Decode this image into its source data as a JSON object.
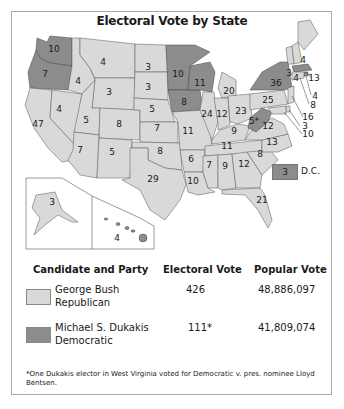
{
  "title": "Electoral Vote by State",
  "colors": {
    "republican": "#d9d9d9",
    "democratic": "#8c8c8c",
    "border": "#a9a9a9"
  },
  "states": [
    {
      "label": "10",
      "party": "democratic",
      "region": "Washington"
    },
    {
      "label": "7",
      "party": "democratic",
      "region": "Oregon"
    },
    {
      "label": "47",
      "party": "republican",
      "region": "California"
    },
    {
      "label": "4",
      "party": "republican",
      "region": "Idaho"
    },
    {
      "label": "4",
      "party": "republican",
      "region": "Nevada"
    },
    {
      "label": "4",
      "party": "republican",
      "region": "Montana"
    },
    {
      "label": "3",
      "party": "republican",
      "region": "Wyoming"
    },
    {
      "label": "5",
      "party": "republican",
      "region": "Utah"
    },
    {
      "label": "8",
      "party": "republican",
      "region": "Colorado"
    },
    {
      "label": "7",
      "party": "republican",
      "region": "Arizona"
    },
    {
      "label": "5",
      "party": "republican",
      "region": "New Mexico"
    },
    {
      "label": "3",
      "party": "republican",
      "region": "North Dakota"
    },
    {
      "label": "3",
      "party": "republican",
      "region": "South Dakota"
    },
    {
      "label": "5",
      "party": "republican",
      "region": "Nebraska"
    },
    {
      "label": "7",
      "party": "republican",
      "region": "Kansas"
    },
    {
      "label": "8",
      "party": "republican",
      "region": "Oklahoma"
    },
    {
      "label": "29",
      "party": "republican",
      "region": "Texas"
    },
    {
      "label": "10",
      "party": "democratic",
      "region": "Minnesota"
    },
    {
      "label": "8",
      "party": "democratic",
      "region": "Iowa"
    },
    {
      "label": "11",
      "party": "republican",
      "region": "Missouri"
    },
    {
      "label": "6",
      "party": "republican",
      "region": "Arkansas"
    },
    {
      "label": "10",
      "party": "republican",
      "region": "Louisiana"
    },
    {
      "label": "11",
      "party": "democratic",
      "region": "Wisconsin"
    },
    {
      "label": "24",
      "party": "republican",
      "region": "Illinois"
    },
    {
      "label": "20",
      "party": "republican",
      "region": "Michigan"
    },
    {
      "label": "12",
      "party": "republican",
      "region": "Indiana"
    },
    {
      "label": "23",
      "party": "republican",
      "region": "Ohio"
    },
    {
      "label": "9",
      "party": "republican",
      "region": "Kentucky"
    },
    {
      "label": "11",
      "party": "republican",
      "region": "Tennessee"
    },
    {
      "label": "7",
      "party": "republican",
      "region": "Mississippi"
    },
    {
      "label": "9",
      "party": "republican",
      "region": "Alabama"
    },
    {
      "label": "12",
      "party": "republican",
      "region": "Georgia"
    },
    {
      "label": "21",
      "party": "republican",
      "region": "Florida"
    },
    {
      "label": "8",
      "party": "republican",
      "region": "South Carolina"
    },
    {
      "label": "13",
      "party": "republican",
      "region": "North Carolina"
    },
    {
      "label": "12",
      "party": "republican",
      "region": "Virginia"
    },
    {
      "label": "5*",
      "party": "democratic",
      "region": "West Virginia"
    },
    {
      "label": "25",
      "party": "republican",
      "region": "Pennsylvania"
    },
    {
      "label": "36",
      "party": "democratic",
      "region": "New York"
    },
    {
      "label": "3",
      "party": "republican",
      "region": "Vermont"
    },
    {
      "label": "4",
      "party": "republican",
      "region": "New Hampshire"
    },
    {
      "label": "4",
      "party": "republican",
      "region": "Maine"
    },
    {
      "label": "13",
      "party": "democratic",
      "region": "Massachusetts"
    },
    {
      "label": "4",
      "party": "democratic",
      "region": "Rhode Island"
    },
    {
      "label": "8",
      "party": "republican",
      "region": "Connecticut"
    },
    {
      "label": "16",
      "party": "republican",
      "region": "New Jersey"
    },
    {
      "label": "3",
      "party": "republican",
      "region": "Delaware"
    },
    {
      "label": "10",
      "party": "republican",
      "region": "Maryland"
    },
    {
      "label": "3",
      "party": "republican",
      "region": "Alaska"
    },
    {
      "label": "4",
      "party": "democratic",
      "region": "Hawaii"
    }
  ],
  "dc": {
    "value": "3",
    "label": "D.C."
  },
  "table": {
    "headers": [
      "Candidate and Party",
      "Electoral Vote",
      "Popular Vote"
    ],
    "rows": [
      {
        "candidate": "George Bush",
        "party": "Republican",
        "electoral": "426",
        "popular": "48,886,097",
        "swatch": "republican"
      },
      {
        "candidate": "Michael S. Dukakis",
        "party": "Democratic",
        "electoral": "111*",
        "popular": "41,809,074",
        "swatch": "democratic"
      }
    ]
  },
  "footnote": "*One Dukakis elector in West Virginia voted for Democratic v. pres. nominee Lloyd Bentsen."
}
